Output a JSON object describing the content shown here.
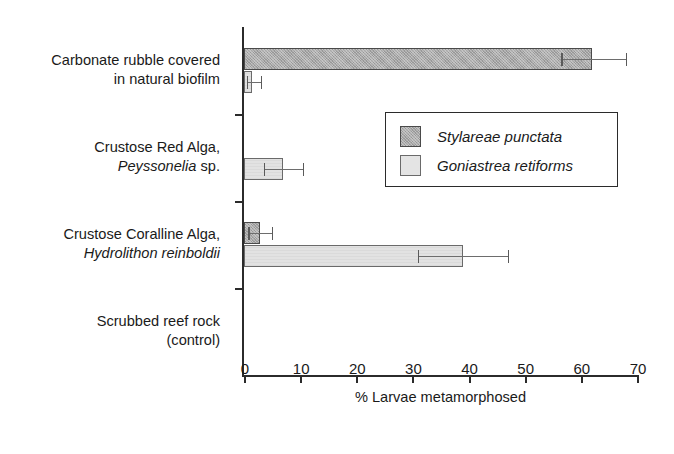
{
  "chart_data": {
    "type": "bar",
    "orientation": "horizontal",
    "title": "",
    "xlabel": "% Larvae metamorphosed",
    "ylabel": "",
    "xlim": [
      0,
      70
    ],
    "xticks": [
      0,
      10,
      20,
      30,
      40,
      50,
      60,
      70
    ],
    "xticklabels": [
      "0",
      "10",
      "20",
      "30",
      "40",
      "50",
      "60",
      "70"
    ],
    "grid": false,
    "legend_position": "center-right",
    "categories": [
      "Carbonate rubble covered in natural biofilm",
      "Crustose Red Alga, Peyssonelia sp.",
      "Crustose Coralline Alga, Hydrolithon reinboldii",
      "Scrubbed reef rock (control)"
    ],
    "category_lines": [
      [
        "Carbonate rubble covered",
        "in natural biofilm"
      ],
      [
        "Crustose Red Alga,",
        "Peyssonelia sp."
      ],
      [
        "Crustose Coralline Alga,",
        "Hydrolithon reinboldii"
      ],
      [
        "Scrubbed reef rock",
        "(control)"
      ]
    ],
    "series": [
      {
        "name": "Stylareae punctata",
        "color": "#a9a9a9",
        "values": [
          62.0,
          0.0,
          2.8,
          0.0
        ],
        "err_low": [
          56.5,
          0.0,
          0.8,
          0.0
        ],
        "err_high": [
          68.0,
          0.0,
          5.0,
          0.0
        ]
      },
      {
        "name": "Goniastrea retiforms",
        "color": "#e2e2e2",
        "values": [
          1.5,
          7.0,
          39.0,
          0.0
        ],
        "err_low": [
          0.5,
          3.5,
          31.0,
          0.0
        ],
        "err_high": [
          3.0,
          10.5,
          47.0,
          0.0
        ]
      }
    ]
  },
  "legend": {
    "entries": [
      {
        "label": "Stylareae punctata",
        "swatch": "dark"
      },
      {
        "label": "Goniastrea retiforms",
        "swatch": "light"
      }
    ]
  },
  "axis": {
    "x_title": "% Larvae metamorphosed"
  }
}
